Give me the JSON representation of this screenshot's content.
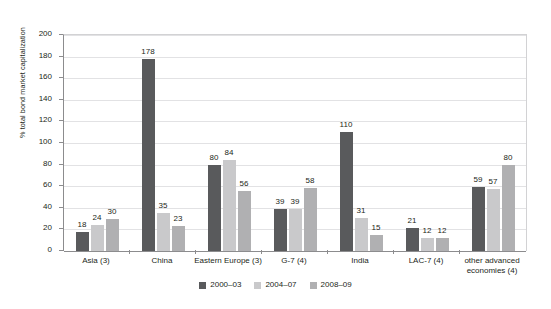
{
  "chart_data": {
    "type": "bar",
    "title": "",
    "xlabel": "",
    "ylabel": "% total bond market capitalization",
    "ylim": [
      0,
      200
    ],
    "ytick_step": 20,
    "yticks": [
      "0",
      "20",
      "40",
      "60",
      "80",
      "100",
      "120",
      "140",
      "160",
      "180",
      "200"
    ],
    "grid": true,
    "legend_position": "bottom-center",
    "categories": [
      "Asia (3)",
      "China",
      "Eastern Europe (3)",
      "G-7 (4)",
      "India",
      "LAC-7 (4)",
      "other advanced economies (4)"
    ],
    "category_lines": [
      [
        "Asia (3)"
      ],
      [
        "China"
      ],
      [
        "Eastern Europe (3)"
      ],
      [
        "G-7 (4)"
      ],
      [
        "India"
      ],
      [
        "LAC-7 (4)"
      ],
      [
        "other advanced",
        "economies (4)"
      ]
    ],
    "series": [
      {
        "name": "2000–03",
        "color": "#595a5c",
        "values": [
          18,
          178,
          80,
          39,
          110,
          21,
          59
        ]
      },
      {
        "name": "2004–07",
        "color": "#c9c9cb",
        "values": [
          24,
          35,
          84,
          39,
          31,
          12,
          57
        ]
      },
      {
        "name": "2008–09",
        "color": "#b0b0b2",
        "values": [
          30,
          23,
          56,
          58,
          15,
          12,
          80
        ]
      }
    ],
    "data_labels": [
      [
        "18",
        "24",
        "30"
      ],
      [
        "178",
        "35",
        "23"
      ],
      [
        "80",
        "84",
        "56"
      ],
      [
        "39",
        "39",
        "58"
      ],
      [
        "110",
        "31",
        "15"
      ],
      [
        "21",
        "12",
        "12"
      ],
      [
        "59",
        "57",
        "80"
      ]
    ]
  },
  "legend": {
    "items": [
      {
        "label": "2000–03",
        "color": "#595a5c"
      },
      {
        "label": "2004–07",
        "color": "#c9c9cb"
      },
      {
        "label": "2008–09",
        "color": "#b0b0b2"
      }
    ]
  },
  "axes": {
    "y_title": "% total bond market capitalization"
  }
}
